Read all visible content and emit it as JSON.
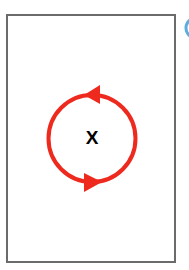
{
  "diagram": {
    "frame": {
      "stroke_color": "#6b6b6b",
      "stroke_width": 2
    },
    "cycle": {
      "label": "X",
      "color": "#ee2a1e",
      "direction": "counterclockwise",
      "arrows": [
        "top-pointing-left",
        "bottom-pointing-right"
      ]
    },
    "badge": {
      "color": "#5aaee0",
      "partially_visible": true
    }
  }
}
